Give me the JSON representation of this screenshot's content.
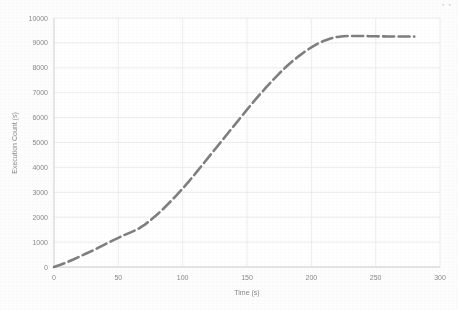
{
  "page": {
    "background_color": "#fdfdfd",
    "corner_mark": "▪ ▪"
  },
  "chart_data": {
    "type": "line",
    "title": "",
    "subtitle": "",
    "xlabel": "Time (s)",
    "ylabel": "Execution Count (s)",
    "xlim": [
      0,
      300
    ],
    "ylim": [
      0,
      10000
    ],
    "xticks": [
      0,
      50,
      100,
      150,
      200,
      250,
      300
    ],
    "yticks": [
      0,
      1000,
      2000,
      3000,
      4000,
      5000,
      6000,
      7000,
      8000,
      9000,
      10000
    ],
    "xtick_labels": [
      "0",
      "50",
      "100",
      "150",
      "200",
      "250",
      "300"
    ],
    "ytick_labels": [
      "0",
      "1000",
      "2000",
      "3000",
      "4000",
      "5000",
      "6000",
      "7000",
      "8000",
      "9000",
      "10000"
    ],
    "grid": true,
    "grid_color": "#e8e8e8",
    "legend": false,
    "legend_position": "none",
    "line_color": "#7f7f7f",
    "line_width": 2.6,
    "line_style": "dashed",
    "series": [
      {
        "name": "Execution Count",
        "x": [
          0,
          5,
          10,
          15,
          20,
          25,
          30,
          35,
          40,
          45,
          50,
          55,
          60,
          65,
          70,
          75,
          80,
          85,
          90,
          95,
          100,
          105,
          110,
          115,
          120,
          125,
          130,
          135,
          140,
          145,
          150,
          155,
          160,
          165,
          170,
          175,
          180,
          185,
          190,
          195,
          200,
          205,
          210,
          215,
          220,
          225,
          230,
          235,
          240,
          245,
          250,
          255,
          260,
          265,
          270,
          275,
          280
        ],
        "values": [
          0,
          90,
          190,
          300,
          420,
          540,
          660,
          790,
          920,
          1050,
          1170,
          1290,
          1400,
          1520,
          1680,
          1880,
          2100,
          2340,
          2600,
          2870,
          3150,
          3450,
          3760,
          4080,
          4400,
          4720,
          5040,
          5360,
          5680,
          6000,
          6320,
          6630,
          6930,
          7220,
          7500,
          7770,
          8020,
          8250,
          8460,
          8650,
          8820,
          8970,
          9090,
          9180,
          9240,
          9270,
          9280,
          9280,
          9275,
          9270,
          9265,
          9262,
          9260,
          9258,
          9256,
          9255,
          9253
        ]
      }
    ],
    "annotations": []
  }
}
